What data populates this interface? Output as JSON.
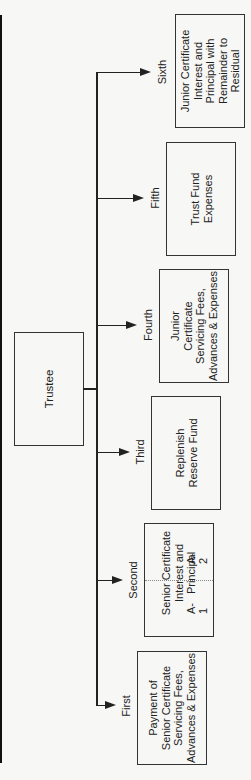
{
  "diagram": {
    "type": "flow-of-funds",
    "orientation": "rotated-90-ccw",
    "root": {
      "label": "Trustee"
    },
    "branches": [
      {
        "order": "First",
        "label_lines": [
          "Payment of",
          "Senior Certificate",
          "Servicing Fees,",
          "Advances & Expenses"
        ]
      },
      {
        "order": "Second",
        "label_lines": [
          "Senior Certificate",
          "Interest and",
          "Principal"
        ],
        "split": {
          "left": "A-1",
          "right": "A-2"
        }
      },
      {
        "order": "Third",
        "label_lines": [
          "Replenish",
          "Reserve Fund"
        ]
      },
      {
        "order": "Fourth",
        "label_lines": [
          "Junior",
          "Certificate",
          "Servicing Fees,",
          "Advances & Expenses"
        ]
      },
      {
        "order": "Fifth",
        "label_lines": [
          "Trust Fund",
          "Expenses"
        ]
      },
      {
        "order": "Sixth",
        "label_lines": [
          "Junior Certificate",
          "Interest and",
          "Principal with",
          "Remainder to",
          "Residual"
        ]
      }
    ]
  },
  "labels": {
    "trustee": "Trustee",
    "first": "First",
    "second": "Second",
    "third": "Third",
    "fourth": "Fourth",
    "fifth": "Fifth",
    "sixth": "Sixth",
    "first_box": "Payment of\nSenior Certificate\nServicing Fees,\nAdvances & Expenses",
    "second_box": "Senior Certificate\nInterest and\nPrincipal",
    "second_a1": "A-1",
    "second_a2": "A-2",
    "third_box": "Replenish\nReserve Fund",
    "fourth_box": "Junior\nCertificate\nServicing Fees,\nAdvances & Expenses",
    "fifth_box": "Trust Fund\nExpenses",
    "sixth_box": "Junior Certificate\nInterest and\nPrincipal with\nRemainder to\nResidual"
  }
}
